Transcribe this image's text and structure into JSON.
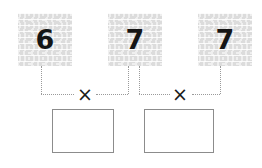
{
  "worksheet": {
    "type": "multiplication-number-tiles",
    "background_color": "#ffffff",
    "tile_fill_color": "#dcdcdc",
    "tile_texture": "wavy-horizontal-lines",
    "connector_color": "#9a9a9a",
    "connector_style": "dotted",
    "box_border_color": "#8c8c8c",
    "digit_color": "#141414"
  },
  "tiles": [
    {
      "id": "tile-1",
      "value": "6",
      "name": "number-tile-6"
    },
    {
      "id": "tile-2",
      "value": "7",
      "name": "number-tile-7-middle"
    },
    {
      "id": "tile-3",
      "value": "7",
      "name": "number-tile-7-right"
    }
  ],
  "operators": [
    {
      "id": "op-1",
      "symbol": "×",
      "name": "multiplication-sign-left"
    },
    {
      "id": "op-2",
      "symbol": "×",
      "name": "multiplication-sign-right"
    }
  ],
  "answer_boxes": [
    {
      "id": "answer-1",
      "value": "",
      "name": "answer-box-left"
    },
    {
      "id": "answer-2",
      "value": "",
      "name": "answer-box-right"
    }
  ],
  "expressions": [
    {
      "left_operand": "6",
      "operator": "×",
      "right_operand": "7",
      "result": ""
    },
    {
      "left_operand": "7",
      "operator": "×",
      "right_operand": "7",
      "result": ""
    }
  ]
}
